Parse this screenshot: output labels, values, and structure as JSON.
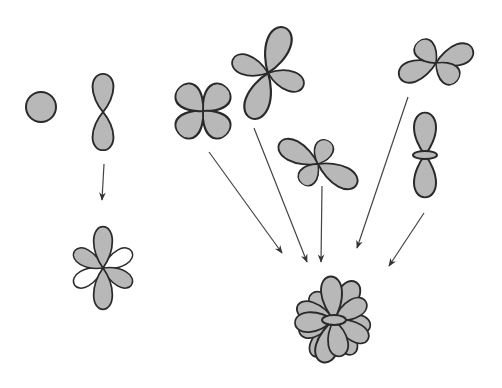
{
  "figure": {
    "colors": {
      "lobe_fill": "#b8b8b8",
      "lobe_outline": "#2a2a2a",
      "white_lobe": "#ffffff",
      "arrow": "#444444",
      "background": "#ffffff"
    },
    "source_orbitals": [
      {
        "id": "s",
        "shape": "sphere"
      },
      {
        "id": "p",
        "shape": "dumbbell-vertical"
      },
      {
        "id": "d-cloverleaf",
        "shape": "four-lobe-x"
      },
      {
        "id": "d-tilted",
        "shape": "four-lobe-tilted"
      },
      {
        "id": "d-butterfly-mid",
        "shape": "four-lobe-horizontal"
      },
      {
        "id": "d-butterfly-top",
        "shape": "four-lobe-horizontal"
      },
      {
        "id": "dz2",
        "shape": "dumbbell-with-torus"
      }
    ],
    "result_orbitals": [
      {
        "id": "sp-hybrid-set",
        "shape": "six-lobe-mixed"
      },
      {
        "id": "combined-cluster",
        "shape": "multi-lobe-cluster"
      }
    ],
    "arrows": [
      {
        "from": "p",
        "to": "sp-hybrid-set"
      },
      {
        "from": "d-cloverleaf",
        "to": "combined-cluster"
      },
      {
        "from": "d-tilted",
        "to": "combined-cluster"
      },
      {
        "from": "d-butterfly-mid",
        "to": "combined-cluster"
      },
      {
        "from": "d-butterfly-top",
        "to": "combined-cluster"
      },
      {
        "from": "dz2",
        "to": "combined-cluster"
      }
    ]
  }
}
